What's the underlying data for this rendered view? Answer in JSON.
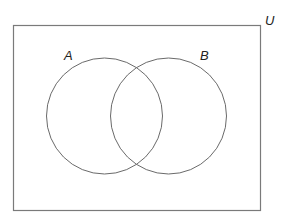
{
  "diagram": {
    "type": "venn",
    "universe": {
      "label": "U",
      "x": 13,
      "y": 25,
      "width": 248,
      "height": 186,
      "stroke": "#7a7a7a"
    },
    "sets": [
      {
        "label": "A",
        "cx": 104.5,
        "cy": 116,
        "r": 58,
        "label_x": 64,
        "label_y": 60
      },
      {
        "label": "B",
        "cx": 168.5,
        "cy": 116,
        "r": 58,
        "label_x": 200,
        "label_y": 60
      }
    ],
    "circle_stroke": "#6a6a6a",
    "universe_label_pos": {
      "x": 265,
      "y": 25
    }
  }
}
